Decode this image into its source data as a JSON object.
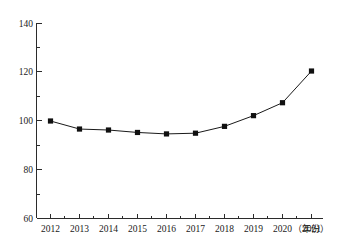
{
  "chart_data": {
    "type": "line",
    "title": "",
    "subtitle": "",
    "xlabel": "（年份）",
    "ylabel": "",
    "categories": [
      "2012",
      "2013",
      "2014",
      "2015",
      "2016",
      "2017",
      "2018",
      "2019",
      "2020",
      "2021"
    ],
    "x": [
      2012,
      2013,
      2014,
      2015,
      2016,
      2017,
      2018,
      2019,
      2020,
      2021
    ],
    "values": [
      100.0,
      96.7,
      96.3,
      95.3,
      94.7,
      95.0,
      97.8,
      102.2,
      107.5,
      120.5
    ],
    "series": [
      {
        "name": "",
        "values": [
          100.0,
          96.7,
          96.3,
          95.3,
          94.7,
          95.0,
          97.8,
          102.2,
          107.5,
          120.5
        ],
        "color": "#101010",
        "marker": "square"
      }
    ],
    "ylim": [
      60,
      140
    ],
    "xlim": [
      2012,
      2021
    ],
    "y_major_ticks": [
      60,
      80,
      100,
      120,
      140
    ],
    "y_minor_ticks": [
      70,
      90,
      110,
      130
    ],
    "y_tick_labels": [
      "60",
      "80",
      "100",
      "120",
      "140"
    ],
    "x_tick_labels": [
      "2012",
      "2013",
      "2014",
      "2015",
      "2016",
      "2017",
      "2018",
      "2019",
      "2020",
      "2021"
    ],
    "grid": false,
    "legend": false,
    "legend_position": "none",
    "annotations": []
  },
  "axes": {
    "y_axis_name": "y-axis",
    "x_axis_name": "x-axis",
    "x_unit_text": "（年份）"
  }
}
